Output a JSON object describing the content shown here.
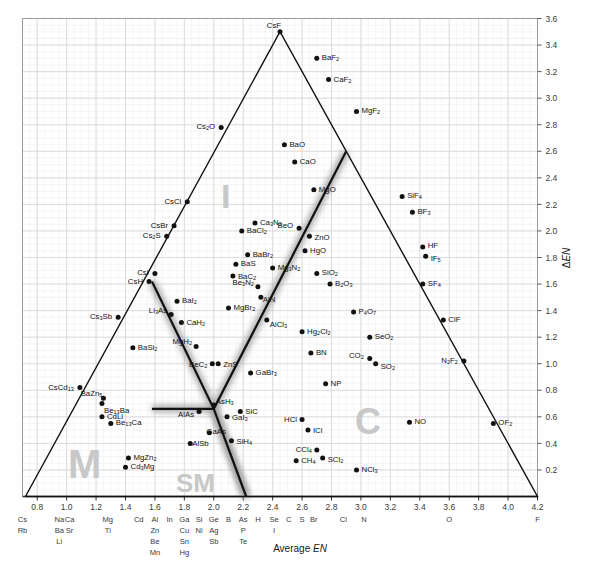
{
  "figure": {
    "axis_titles": {
      "x": "Average EN",
      "x_plain": "Average ",
      "x_italic": "EN",
      "y": "ΔEN"
    },
    "zone_labels": [
      {
        "text": "I",
        "name": "zone-label-ionic",
        "x": 221,
        "y": 208,
        "size": 34
      },
      {
        "text": "M",
        "name": "zone-label-metallic",
        "x": 68,
        "y": 478,
        "size": 40
      },
      {
        "text": "SM",
        "name": "zone-label-semimetallic",
        "x": 176,
        "y": 492,
        "size": 26
      },
      {
        "text": "C",
        "name": "zone-label-covalent",
        "x": 355,
        "y": 434,
        "size": 36
      }
    ]
  },
  "chart_data": {
    "type": "scatter",
    "xlabel": "Average EN",
    "ylabel": "ΔEN",
    "xlim": [
      0.7,
      4.2
    ],
    "ylim": [
      0.0,
      3.7
    ],
    "grid": true,
    "legend": "none",
    "xticks": [
      0.8,
      1.0,
      1.2,
      1.4,
      1.6,
      1.8,
      2.0,
      2.2,
      2.4,
      2.6,
      2.8,
      3.0,
      3.2,
      3.4,
      3.6,
      3.8,
      4.0,
      4.2
    ],
    "yticks": [
      0.2,
      0.4,
      0.6,
      0.8,
      1.0,
      1.2,
      1.4,
      1.6,
      1.8,
      2.0,
      2.2,
      2.4,
      2.6,
      2.8,
      3.0,
      3.2,
      3.4,
      3.6
    ],
    "x_element_columns": [
      {
        "tick": 0.7,
        "elements": [
          "Cs",
          "Rb"
        ]
      },
      {
        "tick": 0.95,
        "elements": [
          "Na",
          "Ba",
          "Li"
        ]
      },
      {
        "tick": 1.02,
        "elements": [
          "Ca",
          "Sr"
        ]
      },
      {
        "tick": 1.28,
        "elements": [
          "Mg",
          "Ti"
        ]
      },
      {
        "tick": 1.49,
        "elements": [
          "Cd"
        ]
      },
      {
        "tick": 1.6,
        "elements": [
          "Al",
          "Zn",
          "Be",
          "Mn"
        ]
      },
      {
        "tick": 1.7,
        "elements": [
          "In"
        ]
      },
      {
        "tick": 1.8,
        "elements": [
          "Ga",
          "Cu",
          "Sn",
          "Hg"
        ]
      },
      {
        "tick": 1.9,
        "elements": [
          "Si",
          "Ni"
        ]
      },
      {
        "tick": 2.0,
        "elements": [
          "Ge",
          "Ag",
          "Sb"
        ]
      },
      {
        "tick": 2.1,
        "elements": [
          "B"
        ]
      },
      {
        "tick": 2.2,
        "elements": [
          "As",
          "P",
          "Te"
        ]
      },
      {
        "tick": 2.3,
        "elements": [
          "H"
        ]
      },
      {
        "tick": 2.41,
        "elements": [
          "Se",
          "I"
        ]
      },
      {
        "tick": 2.51,
        "elements": [
          "C"
        ]
      },
      {
        "tick": 2.6,
        "elements": [
          "S"
        ]
      },
      {
        "tick": 2.68,
        "elements": [
          "Br"
        ]
      },
      {
        "tick": 2.88,
        "elements": [
          "Cl"
        ]
      },
      {
        "tick": 3.02,
        "elements": [
          "N"
        ]
      },
      {
        "tick": 3.6,
        "elements": [
          "O"
        ]
      },
      {
        "tick": 4.2,
        "elements": [
          "F"
        ]
      }
    ],
    "triangle": {
      "apex": [
        2.45,
        3.5
      ],
      "left": [
        0.72,
        0.0
      ],
      "right": [
        4.2,
        0.0
      ],
      "color": "#111111"
    },
    "boundaries": [
      {
        "name": "ionic-metallic-boundary",
        "points": [
          [
            1.58,
            1.62
          ],
          [
            2.0,
            0.66
          ],
          [
            2.22,
            0.0
          ]
        ]
      },
      {
        "name": "ionic-covalent-boundary",
        "points": [
          [
            1.58,
            0.66
          ],
          [
            2.0,
            0.66
          ],
          [
            2.9,
            2.6
          ]
        ]
      }
    ],
    "points": [
      {
        "label": "CsF",
        "x": 2.45,
        "y": 3.5,
        "lx": -6,
        "ly": -7,
        "anchor": "middle"
      },
      {
        "label": "BaF2",
        "x": 2.7,
        "y": 3.3,
        "lx": 5,
        "ly": -1,
        "anchor": "start"
      },
      {
        "label": "CaF2",
        "x": 2.78,
        "y": 3.14,
        "lx": 5,
        "ly": -1,
        "anchor": "start"
      },
      {
        "label": "MgF2",
        "x": 2.97,
        "y": 2.9,
        "lx": 5,
        "ly": -1,
        "anchor": "start"
      },
      {
        "label": "Cs2O",
        "x": 2.05,
        "y": 2.78,
        "lx": -6,
        "ly": -1,
        "anchor": "end"
      },
      {
        "label": "BaO",
        "x": 2.48,
        "y": 2.65,
        "lx": 5,
        "ly": -1,
        "anchor": "start"
      },
      {
        "label": "CaO",
        "x": 2.55,
        "y": 2.52,
        "lx": 5,
        "ly": -1,
        "anchor": "start"
      },
      {
        "label": "MgO",
        "x": 2.68,
        "y": 2.31,
        "lx": 5,
        "ly": -1,
        "anchor": "start"
      },
      {
        "label": "SiF4",
        "x": 3.28,
        "y": 2.26,
        "lx": 5,
        "ly": -1,
        "anchor": "start"
      },
      {
        "label": "BF3",
        "x": 3.35,
        "y": 2.14,
        "lx": 5,
        "ly": -1,
        "anchor": "start"
      },
      {
        "label": "CsCl",
        "x": 1.82,
        "y": 2.22,
        "lx": -6,
        "ly": -1,
        "anchor": "end"
      },
      {
        "label": "CsBr",
        "x": 1.73,
        "y": 2.04,
        "lx": -6,
        "ly": -1,
        "anchor": "end"
      },
      {
        "label": "Ca3N2",
        "x": 2.28,
        "y": 2.06,
        "lx": 5,
        "ly": -1,
        "anchor": "start"
      },
      {
        "label": "BaCl2",
        "x": 2.19,
        "y": 2.0,
        "lx": 5,
        "ly": -1,
        "anchor": "start"
      },
      {
        "label": "Cs2S",
        "x": 1.68,
        "y": 1.96,
        "lx": -6,
        "ly": -1,
        "anchor": "end"
      },
      {
        "label": "BeO",
        "x": 2.58,
        "y": 2.02,
        "lx": -6,
        "ly": -3,
        "anchor": "end"
      },
      {
        "label": "ZnO",
        "x": 2.65,
        "y": 1.96,
        "lx": 5,
        "ly": 1,
        "anchor": "start"
      },
      {
        "label": "HgO",
        "x": 2.62,
        "y": 1.85,
        "lx": 5,
        "ly": -1,
        "anchor": "start"
      },
      {
        "label": "HF",
        "x": 3.42,
        "y": 1.88,
        "lx": 5,
        "ly": -2,
        "anchor": "start"
      },
      {
        "label": "IF5",
        "x": 3.44,
        "y": 1.81,
        "lx": 5,
        "ly": 2,
        "anchor": "start"
      },
      {
        "label": "BaBr2",
        "x": 2.23,
        "y": 1.82,
        "lx": 5,
        "ly": -1,
        "anchor": "start"
      },
      {
        "label": "BaS",
        "x": 2.15,
        "y": 1.75,
        "lx": 5,
        "ly": -1,
        "anchor": "start"
      },
      {
        "label": "Mg3N2",
        "x": 2.4,
        "y": 1.72,
        "lx": 5,
        "ly": -1,
        "anchor": "start"
      },
      {
        "label": "SiO2",
        "x": 2.7,
        "y": 1.68,
        "lx": 5,
        "ly": -1,
        "anchor": "start"
      },
      {
        "label": "CsI",
        "x": 1.6,
        "y": 1.68,
        "lx": -6,
        "ly": -1,
        "anchor": "end"
      },
      {
        "label": "BaC2",
        "x": 2.13,
        "y": 1.66,
        "lx": 5,
        "ly": 0,
        "anchor": "start"
      },
      {
        "label": "CsH",
        "x": 1.56,
        "y": 1.62,
        "lx": -6,
        "ly": 0,
        "anchor": "end"
      },
      {
        "label": "B2O3",
        "x": 2.79,
        "y": 1.6,
        "lx": 5,
        "ly": -1,
        "anchor": "start"
      },
      {
        "label": "Be3N2",
        "x": 2.3,
        "y": 1.58,
        "lx": -4,
        "ly": -5,
        "anchor": "end"
      },
      {
        "label": "AlN",
        "x": 2.32,
        "y": 1.5,
        "lx": 2,
        "ly": 2,
        "anchor": "start"
      },
      {
        "label": "SF4",
        "x": 3.42,
        "y": 1.6,
        "lx": 5,
        "ly": -1,
        "anchor": "start"
      },
      {
        "label": "BaI2",
        "x": 1.75,
        "y": 1.47,
        "lx": 5,
        "ly": -1,
        "anchor": "start"
      },
      {
        "label": "MgBr2",
        "x": 2.1,
        "y": 1.42,
        "lx": 5,
        "ly": -1,
        "anchor": "start"
      },
      {
        "label": "P4O7",
        "x": 2.95,
        "y": 1.39,
        "lx": 5,
        "ly": -1,
        "anchor": "start"
      },
      {
        "label": "ClF",
        "x": 3.56,
        "y": 1.33,
        "lx": 5,
        "ly": -1,
        "anchor": "start"
      },
      {
        "label": "Li3As",
        "x": 1.71,
        "y": 1.37,
        "lx": -4,
        "ly": -5,
        "anchor": "end"
      },
      {
        "label": "AlCl3",
        "x": 2.36,
        "y": 1.33,
        "lx": 3,
        "ly": 4,
        "anchor": "start"
      },
      {
        "label": "Cs3Sb",
        "x": 1.35,
        "y": 1.35,
        "lx": -6,
        "ly": -1,
        "anchor": "end"
      },
      {
        "label": "CaH2",
        "x": 1.78,
        "y": 1.31,
        "lx": 5,
        "ly": -1,
        "anchor": "start"
      },
      {
        "label": "Hg2Cl2",
        "x": 2.6,
        "y": 1.24,
        "lx": 5,
        "ly": -1,
        "anchor": "start"
      },
      {
        "label": "SeO2",
        "x": 3.06,
        "y": 1.2,
        "lx": 5,
        "ly": -1,
        "anchor": "start"
      },
      {
        "label": "N2F2",
        "x": 3.7,
        "y": 1.02,
        "lx": -6,
        "ly": -1,
        "anchor": "end"
      },
      {
        "label": "MgH2",
        "x": 1.88,
        "y": 1.13,
        "lx": -4,
        "ly": -5,
        "anchor": "end"
      },
      {
        "label": "BaSi2",
        "x": 1.45,
        "y": 1.12,
        "lx": 5,
        "ly": -1,
        "anchor": "start"
      },
      {
        "label": "BN",
        "x": 2.66,
        "y": 1.08,
        "lx": 5,
        "ly": -1,
        "anchor": "start"
      },
      {
        "label": "CO2",
        "x": 3.06,
        "y": 1.04,
        "lx": -6,
        "ly": -3,
        "anchor": "end"
      },
      {
        "label": "SO2",
        "x": 3.1,
        "y": 1.0,
        "lx": 5,
        "ly": 2,
        "anchor": "start"
      },
      {
        "label": "BeC2",
        "x": 1.99,
        "y": 1.0,
        "lx": -5,
        "ly": 0,
        "anchor": "end"
      },
      {
        "label": "ZnS",
        "x": 2.03,
        "y": 1.0,
        "lx": 5,
        "ly": 0,
        "anchor": "start"
      },
      {
        "label": "GaBr3",
        "x": 2.25,
        "y": 0.93,
        "lx": 5,
        "ly": -1,
        "anchor": "start"
      },
      {
        "label": "NP",
        "x": 2.76,
        "y": 0.85,
        "lx": 5,
        "ly": -1,
        "anchor": "start"
      },
      {
        "label": "CsCd13",
        "x": 1.09,
        "y": 0.82,
        "lx": -6,
        "ly": -1,
        "anchor": "end"
      },
      {
        "label": "BaZn5",
        "x": 1.25,
        "y": 0.74,
        "lx": -1,
        "ly": -5,
        "anchor": "end"
      },
      {
        "label": "Be13Ba",
        "x": 1.24,
        "y": 0.7,
        "lx": 2,
        "ly": 6,
        "anchor": "start"
      },
      {
        "label": "AsH3",
        "x": 2.0,
        "y": 0.69,
        "lx": 2,
        "ly": -4,
        "anchor": "start"
      },
      {
        "label": "SiC",
        "x": 2.18,
        "y": 0.64,
        "lx": 5,
        "ly": -1,
        "anchor": "start"
      },
      {
        "label": "CdLi",
        "x": 1.24,
        "y": 0.6,
        "lx": 5,
        "ly": -1,
        "anchor": "start"
      },
      {
        "label": "AlAs",
        "x": 1.9,
        "y": 0.64,
        "lx": -5,
        "ly": 2,
        "anchor": "end"
      },
      {
        "label": "GaI3",
        "x": 2.09,
        "y": 0.6,
        "lx": 5,
        "ly": 0,
        "anchor": "start"
      },
      {
        "label": "HCl",
        "x": 2.6,
        "y": 0.58,
        "lx": -5,
        "ly": 0,
        "anchor": "end"
      },
      {
        "label": "NO",
        "x": 3.33,
        "y": 0.56,
        "lx": 5,
        "ly": -1,
        "anchor": "start"
      },
      {
        "label": "OF2",
        "x": 3.9,
        "y": 0.55,
        "lx": 5,
        "ly": -1,
        "anchor": "start"
      },
      {
        "label": "Be13Ca",
        "x": 1.3,
        "y": 0.55,
        "lx": 5,
        "ly": -1,
        "anchor": "start"
      },
      {
        "label": "ICl",
        "x": 2.64,
        "y": 0.5,
        "lx": 5,
        "ly": 0,
        "anchor": "start"
      },
      {
        "label": "GaAs",
        "x": 1.97,
        "y": 0.48,
        "lx": -3,
        "ly": -2,
        "anchor": "start"
      },
      {
        "label": "SiH4",
        "x": 2.12,
        "y": 0.42,
        "lx": 5,
        "ly": 0,
        "anchor": "start"
      },
      {
        "label": "AlSb",
        "x": 1.84,
        "y": 0.4,
        "lx": 2,
        "ly": 0,
        "anchor": "start"
      },
      {
        "label": "CCl4",
        "x": 2.7,
        "y": 0.35,
        "lx": -5,
        "ly": -1,
        "anchor": "end"
      },
      {
        "label": "MgZn2",
        "x": 1.42,
        "y": 0.29,
        "lx": 5,
        "ly": -1,
        "anchor": "start"
      },
      {
        "label": "CH4",
        "x": 2.56,
        "y": 0.27,
        "lx": 5,
        "ly": -1,
        "anchor": "start"
      },
      {
        "label": "SCl2",
        "x": 2.74,
        "y": 0.29,
        "lx": 5,
        "ly": 1,
        "anchor": "start"
      },
      {
        "label": "Cd3Mg",
        "x": 1.4,
        "y": 0.22,
        "lx": 5,
        "ly": -1,
        "anchor": "start"
      },
      {
        "label": "NCl3",
        "x": 2.97,
        "y": 0.2,
        "lx": 5,
        "ly": -1,
        "anchor": "start"
      }
    ]
  }
}
